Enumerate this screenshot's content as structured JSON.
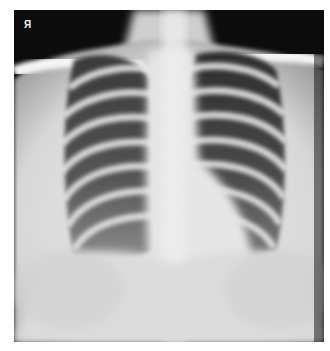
{
  "image": {
    "type": "chest-xray",
    "view": "posteroanterior",
    "marker_label": "R",
    "marker_glyph": "Я"
  }
}
